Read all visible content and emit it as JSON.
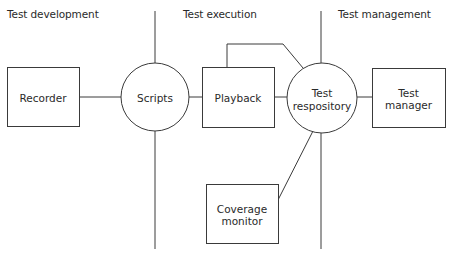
{
  "diagram": {
    "style": {
      "stroke": "#3a3a3a",
      "stroke_width": 1,
      "background": "#ffffff"
    },
    "sections": [
      {
        "id": "dev",
        "label": "Test development",
        "x": 7,
        "y": 8
      },
      {
        "id": "exec",
        "label": "Test execution",
        "x": 183,
        "y": 8
      },
      {
        "id": "mgmt",
        "label": "Test management",
        "x": 338,
        "y": 8
      }
    ],
    "nodes": [
      {
        "id": "recorder",
        "shape": "rect",
        "label": "Recorder",
        "x": 7,
        "y": 67,
        "w": 72,
        "h": 59
      },
      {
        "id": "scripts",
        "shape": "circle",
        "label": "Scripts",
        "cx": 155,
        "cy": 97,
        "r": 34
      },
      {
        "id": "playback",
        "shape": "rect",
        "label": "Playback",
        "x": 202,
        "y": 67,
        "w": 72,
        "h": 60
      },
      {
        "id": "repository",
        "shape": "circle",
        "label": "Test\nrespository",
        "cx": 322,
        "cy": 98,
        "r": 35
      },
      {
        "id": "manager",
        "shape": "rect",
        "label": "Test\nmanager",
        "x": 372,
        "y": 68,
        "w": 73,
        "h": 59
      },
      {
        "id": "coverage",
        "shape": "rect",
        "label": "Coverage\nmonitor",
        "x": 206,
        "y": 184,
        "w": 72,
        "h": 59
      }
    ],
    "lines": [
      {
        "id": "divider-1-top",
        "points": [
          [
            155,
            11
          ],
          [
            155,
            63
          ]
        ]
      },
      {
        "id": "divider-1-bottom",
        "points": [
          [
            155,
            131
          ],
          [
            155,
            249
          ]
        ]
      },
      {
        "id": "divider-2-top",
        "points": [
          [
            321,
            11
          ],
          [
            321,
            63
          ]
        ]
      },
      {
        "id": "divider-2-bottom",
        "points": [
          [
            321,
            133
          ],
          [
            321,
            249
          ]
        ]
      },
      {
        "id": "recorder-scripts",
        "points": [
          [
            79,
            97
          ],
          [
            121,
            97
          ]
        ]
      },
      {
        "id": "scripts-playback",
        "points": [
          [
            189,
            97
          ],
          [
            202,
            97
          ]
        ]
      },
      {
        "id": "playback-repository-direct",
        "points": [
          [
            274,
            97
          ],
          [
            287,
            97
          ]
        ]
      },
      {
        "id": "playback-repository-loop",
        "points": [
          [
            227,
            67
          ],
          [
            227,
            44
          ],
          [
            283,
            44
          ],
          [
            303,
            68
          ]
        ]
      },
      {
        "id": "repository-manager",
        "points": [
          [
            357,
            97
          ],
          [
            372,
            97
          ]
        ]
      },
      {
        "id": "repository-coverage",
        "points": [
          [
            313,
            131
          ],
          [
            278,
            200
          ]
        ]
      }
    ]
  }
}
